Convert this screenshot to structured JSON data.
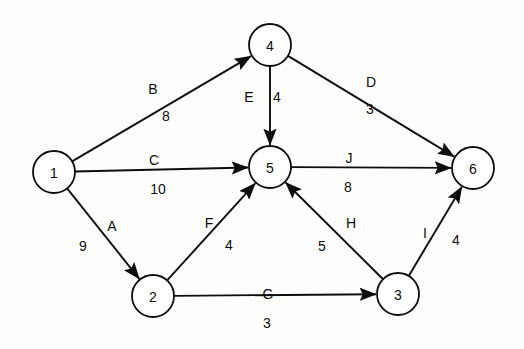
{
  "diagram": {
    "canvas": {
      "width": 524,
      "height": 349,
      "background": "#fdfdfc"
    },
    "style": {
      "stroke": "#0d0d0d",
      "node_fill": "#ffffff",
      "node_radius": 21
    },
    "nodes": [
      {
        "id": "1",
        "label": "1",
        "x": 54,
        "y": 172
      },
      {
        "id": "2",
        "label": "2",
        "x": 153,
        "y": 296
      },
      {
        "id": "3",
        "label": "3",
        "x": 398,
        "y": 294
      },
      {
        "id": "4",
        "label": "4",
        "x": 270,
        "y": 45
      },
      {
        "id": "5",
        "label": "5",
        "x": 270,
        "y": 167
      },
      {
        "id": "6",
        "label": "6",
        "x": 473,
        "y": 168
      }
    ],
    "edges": [
      {
        "id": "A",
        "name": "A",
        "weight": "9",
        "from": "1",
        "to": "2",
        "name_x": 112,
        "name_y": 226,
        "weight_x": 83,
        "weight_y": 246
      },
      {
        "id": "B",
        "name": "B",
        "weight": "8",
        "from": "1",
        "to": "4",
        "name_x": 153,
        "name_y": 89,
        "weight_x": 166,
        "weight_y": 116
      },
      {
        "id": "C",
        "name": "C",
        "weight": "10",
        "from": "1",
        "to": "5",
        "name_x": 154,
        "name_y": 160,
        "weight_x": 158,
        "weight_y": 189
      },
      {
        "id": "D",
        "name": "D",
        "weight": "3",
        "from": "4",
        "to": "6",
        "name_x": 371,
        "name_y": 82,
        "weight_x": 370,
        "weight_y": 109
      },
      {
        "id": "E",
        "name": "E",
        "weight": "4",
        "from": "4",
        "to": "5",
        "name_x": 249,
        "name_y": 97,
        "weight_x": 277,
        "weight_y": 97
      },
      {
        "id": "F",
        "name": "F",
        "weight": "4",
        "from": "2",
        "to": "5",
        "name_x": 209,
        "name_y": 223,
        "weight_x": 229,
        "weight_y": 245
      },
      {
        "id": "G",
        "name": "G",
        "weight": "3",
        "from": "2",
        "to": "3",
        "name_x": 268,
        "name_y": 294,
        "weight_x": 267,
        "weight_y": 323
      },
      {
        "id": "H",
        "name": "H",
        "weight": "5",
        "from": "3",
        "to": "5",
        "name_x": 351,
        "name_y": 223,
        "weight_x": 322,
        "weight_y": 246
      },
      {
        "id": "I",
        "name": "I",
        "weight": "4",
        "from": "3",
        "to": "6",
        "name_x": 425,
        "name_y": 233,
        "weight_x": 456,
        "weight_y": 240
      },
      {
        "id": "J",
        "name": "J",
        "weight": "8",
        "from": "5",
        "to": "6",
        "name_x": 349,
        "name_y": 158,
        "weight_x": 348,
        "weight_y": 187
      }
    ]
  }
}
